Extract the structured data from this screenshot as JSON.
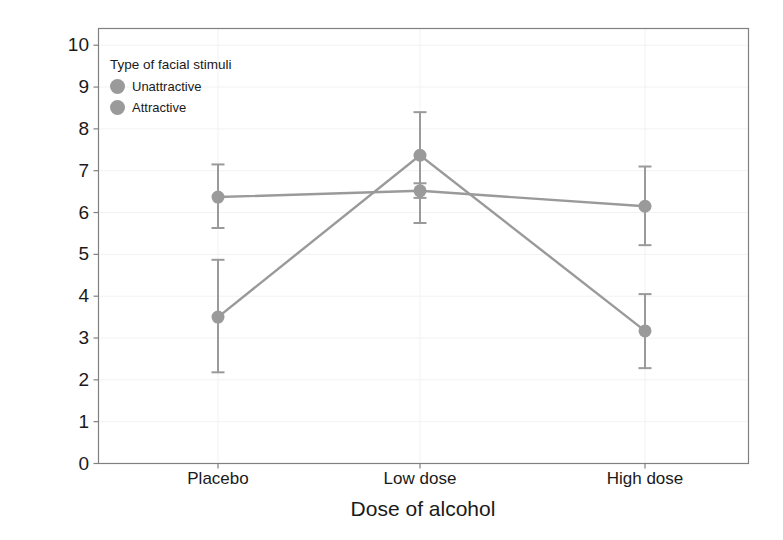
{
  "chart_data": {
    "type": "line",
    "title": "",
    "xlabel": "Dose of alcohol",
    "ylabel": "Mean attractiveness rating",
    "categories": [
      "Placebo",
      "Low dose",
      "High dose"
    ],
    "ylim": [
      0,
      10.4
    ],
    "yticks": [
      0,
      1,
      2,
      3,
      4,
      5,
      6,
      7,
      8,
      9,
      10
    ],
    "ytick_labels": [
      "0",
      "1",
      "2",
      "3",
      "4",
      "5",
      "6",
      "7",
      "8",
      "9",
      "10"
    ],
    "grid": true,
    "legend_position": "top-left-inside",
    "legend_title": "Type of facial stimuli",
    "series": [
      {
        "name": "Unattractive",
        "color": "#9a9a9a",
        "values": [
          6.37,
          6.52,
          6.15
        ],
        "error_low": [
          5.63,
          6.35,
          5.22
        ],
        "error_high": [
          7.15,
          6.7,
          7.1
        ]
      },
      {
        "name": "Attractive",
        "color": "#9a9a9a",
        "values": [
          3.5,
          7.37,
          3.17
        ],
        "error_low": [
          2.18,
          5.75,
          2.28
        ],
        "error_high": [
          4.87,
          8.4,
          4.05
        ]
      }
    ]
  },
  "legend": {
    "title": "Type of facial stimuli",
    "entries": [
      {
        "label": "Unattractive",
        "key": "circle-marker"
      },
      {
        "label": "Attractive",
        "key": "circle-marker"
      }
    ]
  },
  "axes": {
    "y_title": "Mean attractiveness rating",
    "x_title": "Dose of alcohol"
  },
  "colors": {
    "series": "#9a9a9a",
    "panel_border": "#808080",
    "grid": "#f2f2f2",
    "text": "#1a1a1a",
    "background": "#ffffff"
  }
}
